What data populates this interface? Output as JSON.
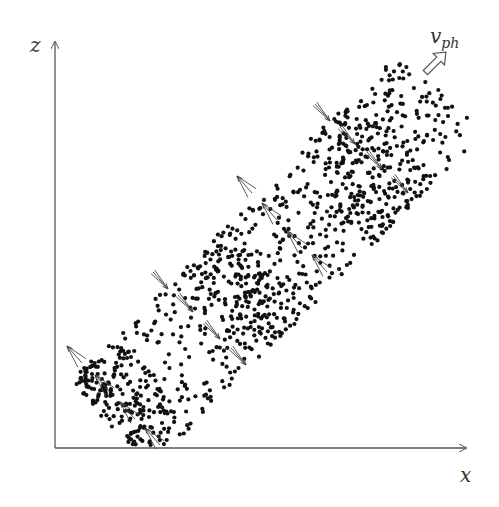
{
  "figure": {
    "type": "diagram",
    "colors": {
      "dots": "#111111",
      "axes": "#555555",
      "arrows": "#444444",
      "background": "#ffffff"
    },
    "axes": {
      "x_label": "x",
      "z_label": "z",
      "origin": [
        55,
        448
      ],
      "x_end": [
        467,
        448
      ],
      "z_end": [
        55,
        40
      ]
    },
    "phase_velocity": {
      "label_main": "v",
      "label_sub": "ph",
      "arrow_direction": "up-right (45°)"
    },
    "particle_region": {
      "shape": "tilted band along 45° direction",
      "corners": [
        [
          55,
          395
        ],
        [
          170,
          448
        ],
        [
          470,
          150
        ],
        [
          380,
          40
        ]
      ],
      "dense_bands": 3
    },
    "velocity_arrows": {
      "style": "fan of 3 thin arrows",
      "groups": [
        {
          "direction": "up-left",
          "positions": [
            [
              75,
              355
            ],
            [
              103,
              384
            ],
            [
              128,
              411
            ],
            [
              153,
              437
            ]
          ]
        },
        {
          "direction": "down-right",
          "positions": [
            [
              160,
              280
            ],
            [
              185,
              303
            ],
            [
              212,
              330
            ],
            [
              238,
              356
            ]
          ]
        },
        {
          "direction": "up-left",
          "positions": [
            [
              245,
              185
            ],
            [
              270,
              212
            ],
            [
              295,
              240
            ],
            [
              320,
              264
            ]
          ]
        },
        {
          "direction": "down-right",
          "positions": [
            [
              322,
              112
            ],
            [
              347,
              135
            ],
            [
              374,
              160
            ],
            [
              400,
              184
            ]
          ]
        }
      ]
    }
  }
}
